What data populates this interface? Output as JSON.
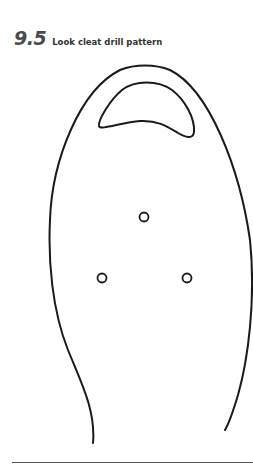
{
  "heading": {
    "number": "9.5",
    "title": "Look cleat drill pattern"
  },
  "figure": {
    "holes": [
      {
        "cx": 144,
        "cy": 217,
        "r": 4.5
      },
      {
        "cx": 102,
        "cy": 278,
        "r": 4.5
      },
      {
        "cx": 187,
        "cy": 278,
        "r": 4.5
      }
    ],
    "stroke_color": "#1a1a1a"
  }
}
